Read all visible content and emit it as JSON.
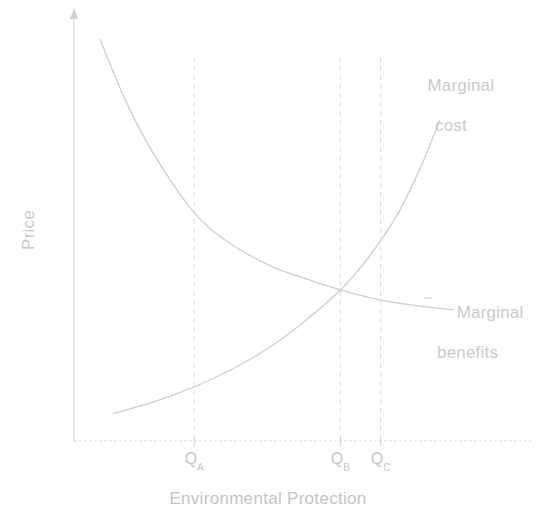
{
  "chart_data": {
    "type": "line",
    "title": "",
    "xlabel": "Environmental Protection",
    "ylabel": "Price",
    "grid": false,
    "legend_position": "inline-right",
    "axis_style": "arrow-y-axis, dashed-x-axis, unscaled qualitative axes",
    "xlim": [
      0,
      1
    ],
    "ylim": [
      0,
      1
    ],
    "annotations": [
      {
        "name": "marginal-cost-label",
        "text_lines": [
          "Marginal",
          "cost"
        ],
        "align": "center",
        "x": 0.72,
        "y": 0.88
      },
      {
        "name": "marginal-benefits-label",
        "text_lines": [
          "Marginal",
          "benefits"
        ],
        "align": "left",
        "x": 0.86,
        "y": 0.41
      }
    ],
    "xticks": [
      {
        "id": "QA",
        "label": "Q",
        "subscript": "A",
        "x": 0.263,
        "dashed_vertical": true
      },
      {
        "id": "QB",
        "label": "Q",
        "subscript": "B",
        "x": 0.583,
        "dashed_vertical": true
      },
      {
        "id": "QC",
        "label": "Q",
        "subscript": "C",
        "x": 0.671,
        "dashed_vertical": true
      }
    ],
    "yticks": [],
    "intersection": {
      "x": 0.583,
      "y": 0.357,
      "label": "MC = MB at Q_B"
    },
    "series": [
      {
        "name": "Marginal benefits",
        "shape": "decreasing convex",
        "color": "#cfcfcf",
        "points": [
          {
            "x": 0.057,
            "y": 0.949
          },
          {
            "x": 0.115,
            "y": 0.8
          },
          {
            "x": 0.176,
            "y": 0.676
          },
          {
            "x": 0.263,
            "y": 0.54
          },
          {
            "x": 0.34,
            "y": 0.468
          },
          {
            "x": 0.43,
            "y": 0.414
          },
          {
            "x": 0.5,
            "y": 0.386
          },
          {
            "x": 0.583,
            "y": 0.357
          },
          {
            "x": 0.671,
            "y": 0.333
          },
          {
            "x": 0.77,
            "y": 0.317
          },
          {
            "x": 0.83,
            "y": 0.31
          }
        ]
      },
      {
        "name": "Marginal cost",
        "shape": "increasing convex",
        "color": "#cfcfcf",
        "points": [
          {
            "x": 0.086,
            "y": 0.065
          },
          {
            "x": 0.176,
            "y": 0.093
          },
          {
            "x": 0.263,
            "y": 0.128
          },
          {
            "x": 0.35,
            "y": 0.172
          },
          {
            "x": 0.43,
            "y": 0.223
          },
          {
            "x": 0.5,
            "y": 0.279
          },
          {
            "x": 0.583,
            "y": 0.357
          },
          {
            "x": 0.65,
            "y": 0.442
          },
          {
            "x": 0.71,
            "y": 0.54
          },
          {
            "x": 0.76,
            "y": 0.651
          },
          {
            "x": 0.8,
            "y": 0.758
          }
        ]
      }
    ]
  },
  "axes": {
    "y_title": "Price",
    "x_title": "Environmental Protection"
  },
  "labels": {
    "marginal_cost_line1": "Marginal",
    "marginal_cost_line2": "cost",
    "marginal_benefits_line1": "Marginal",
    "marginal_benefits_line2": "benefits"
  },
  "ticks": {
    "qa_base": "Q",
    "qa_sub": "A",
    "qb_base": "Q",
    "qb_sub": "B",
    "qc_base": "Q",
    "qc_sub": "C"
  },
  "colors": {
    "curve": "#cfcfcf",
    "axis": "#d2d2d2",
    "dashed_guide": "#dcdcdc",
    "text": "#c8c8c8",
    "background": "#ffffff"
  }
}
